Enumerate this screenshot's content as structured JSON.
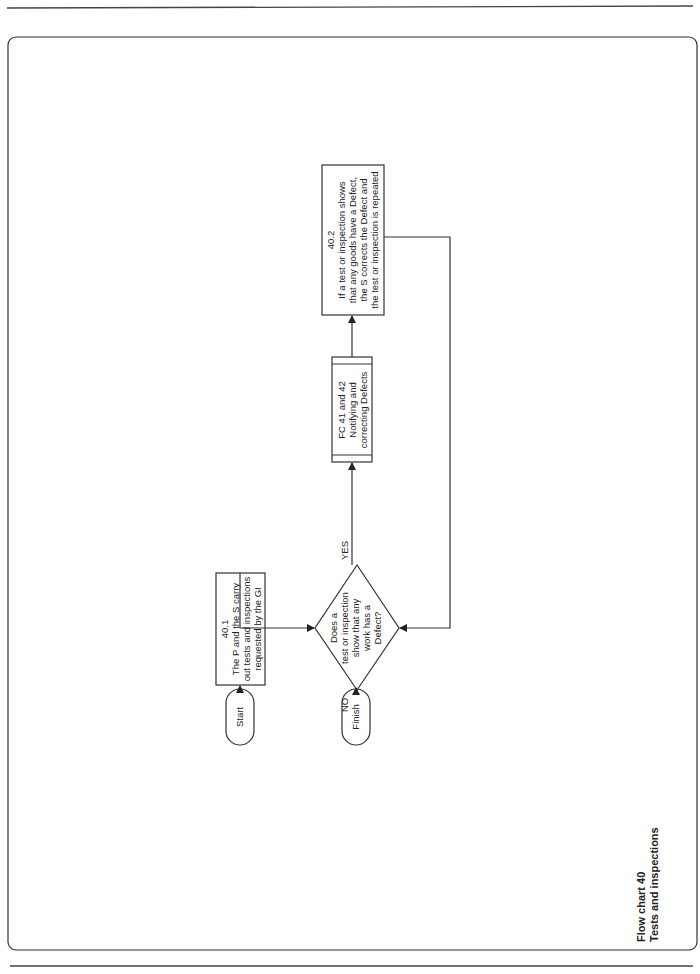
{
  "page": {
    "caption_line1": "Flow chart 40",
    "caption_line2": "Tests and inspections"
  },
  "flowchart": {
    "nodes": {
      "start": {
        "type": "terminator",
        "label": "Start"
      },
      "step_40_1": {
        "type": "process",
        "lines": [
          "40.1",
          "The P and the S carry",
          "out tests and inspections",
          "requested by the GI"
        ]
      },
      "decision": {
        "type": "decision",
        "lines": [
          "Does a",
          "test or inspection",
          "show that any",
          "work has a",
          "Defect?"
        ]
      },
      "subprocess_fc41_42": {
        "type": "predefined-process",
        "lines": [
          "FC 41 and 42",
          "Notifying and",
          "correcting Defects"
        ]
      },
      "step_40_2": {
        "type": "process",
        "lines": [
          "40.2",
          "If a test or inspection shows",
          "that any goods have a Defect,",
          "the S corrects the Defect and",
          "the test or inspection is repeated"
        ]
      },
      "finish": {
        "type": "terminator",
        "label": "Finish"
      }
    },
    "edges": [
      {
        "from": "start",
        "to": "step_40_1",
        "label": ""
      },
      {
        "from": "step_40_1",
        "to": "decision",
        "label": ""
      },
      {
        "from": "decision",
        "to": "subprocess_fc41_42",
        "label": "YES"
      },
      {
        "from": "decision",
        "to": "finish",
        "label": "NO"
      },
      {
        "from": "subprocess_fc41_42",
        "to": "step_40_2",
        "label": ""
      },
      {
        "from": "step_40_2",
        "to": "decision",
        "label": ""
      }
    ],
    "edge_labels": {
      "yes": "YES",
      "no": "NO"
    }
  },
  "colors": {
    "line": "#333333",
    "background": "#ffffff"
  }
}
